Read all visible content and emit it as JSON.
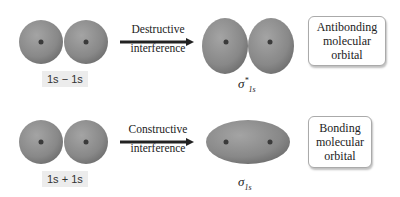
{
  "colors": {
    "orbital_fill": "#8a8a8a",
    "orbital_dark": "#6a6a6a",
    "nucleus": "#3a3a3a",
    "arrow": "#222222",
    "tag_bg": "#ececec",
    "box_border": "#aaaaaa"
  },
  "rows": [
    {
      "left_label": "1s − 1s",
      "arrow_label_line1": "Destructive",
      "arrow_label_line2": "interference",
      "result_symbol": "σ",
      "result_sub": "1s",
      "result_sup": "*",
      "box_line1": "Antibonding",
      "box_line2": "molecular",
      "box_line3": "orbital"
    },
    {
      "left_label": "1s + 1s",
      "arrow_label_line1": "Constructive",
      "arrow_label_line2": "interference",
      "result_symbol": "σ",
      "result_sub": "1s",
      "box_line1": "Bonding",
      "box_line2": "molecular",
      "box_line3": "orbital"
    }
  ]
}
